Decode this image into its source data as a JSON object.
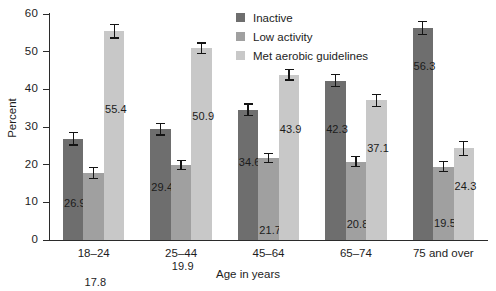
{
  "chart_data": {
    "type": "bar",
    "title": "",
    "xlabel": "Age in years",
    "ylabel": "Percent",
    "ylim": [
      0,
      60
    ],
    "yticks": [
      0,
      10,
      20,
      30,
      40,
      50,
      60
    ],
    "grid": false,
    "legend_position": "top-center-right",
    "categories": [
      "18–24",
      "25–44",
      "45–64",
      "65–74",
      "75 and over"
    ],
    "series": [
      {
        "name": "Inactive",
        "color": "#6e6e6e",
        "values": [
          26.9,
          29.4,
          34.6,
          42.3,
          56.3
        ],
        "errors": [
          1.7,
          1.5,
          1.5,
          1.6,
          1.7
        ]
      },
      {
        "name": "Low activity",
        "color": "#a0a0a0",
        "values": [
          17.8,
          19.9,
          21.7,
          20.8,
          19.5
        ],
        "errors": [
          1.5,
          1.2,
          1.2,
          1.3,
          1.4
        ]
      },
      {
        "name": "Met aerobic guidelines",
        "color": "#c8c8c8",
        "values": [
          55.4,
          50.9,
          43.9,
          37.1,
          24.3
        ],
        "errors": [
          1.8,
          1.4,
          1.4,
          1.6,
          1.8
        ]
      }
    ]
  }
}
